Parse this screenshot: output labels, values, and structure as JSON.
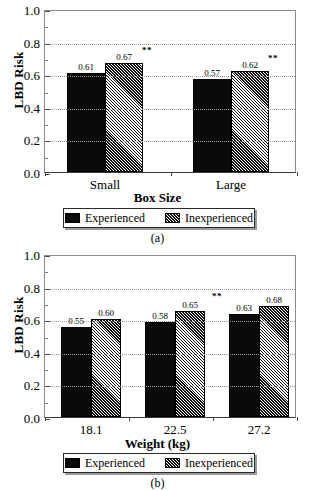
{
  "figure": {
    "panels": [
      {
        "caption": "(a)",
        "ylabel": "LBD Risk",
        "xlabel": "Box Size",
        "ytick_labels": [
          "0.0",
          "0.2",
          "0.4",
          "0.6",
          "0.8",
          "1.0"
        ],
        "xtick_labels": [
          "Small",
          "Large"
        ],
        "legend": [
          {
            "label": "Experienced",
            "style": "solid"
          },
          {
            "label": "Inexperienced",
            "style": "hatch"
          }
        ],
        "value_labels": [
          "0.61",
          "0.67",
          "0.57",
          "0.62"
        ],
        "sig_marks": [
          "**",
          "**"
        ]
      },
      {
        "caption": "(b)",
        "ylabel": "LBD Risk",
        "xlabel": "Weight (kg)",
        "ytick_labels": [
          "0.0",
          "0.2",
          "0.4",
          "0.6",
          "0.8",
          "1.0"
        ],
        "xtick_labels": [
          "18.1",
          "22.5",
          "27.2"
        ],
        "legend": [
          {
            "label": "Experienced",
            "style": "solid"
          },
          {
            "label": "Inexperienced",
            "style": "hatch"
          }
        ],
        "value_labels": [
          "0.55",
          "0.60",
          "0.58",
          "0.65",
          "0.63",
          "0.68"
        ],
        "sig_marks": [
          "**"
        ]
      }
    ]
  },
  "chart_data": [
    {
      "type": "bar",
      "title": "(a)",
      "xlabel": "Box Size",
      "ylabel": "LBD Risk",
      "categories": [
        "Small",
        "Large"
      ],
      "ylim": [
        0.0,
        1.0
      ],
      "ytick_values": [
        0.0,
        0.2,
        0.4,
        0.6,
        0.8,
        1.0
      ],
      "grid": true,
      "legend_position": "below-axis",
      "series": [
        {
          "name": "Experienced",
          "values": [
            0.61,
            0.57
          ],
          "fill": "solid-black"
        },
        {
          "name": "Inexperienced",
          "values": [
            0.67,
            0.62
          ],
          "fill": "diagonal-hatch"
        }
      ],
      "annotations": [
        {
          "category": "Small",
          "series": "Inexperienced",
          "text": "**"
        },
        {
          "category": "Large",
          "series": "Inexperienced",
          "text": "**"
        }
      ]
    },
    {
      "type": "bar",
      "title": "(b)",
      "xlabel": "Weight (kg)",
      "ylabel": "LBD Risk",
      "categories": [
        "18.1",
        "22.5",
        "27.2"
      ],
      "ylim": [
        0.0,
        1.0
      ],
      "ytick_values": [
        0.0,
        0.2,
        0.4,
        0.6,
        0.8,
        1.0
      ],
      "grid": true,
      "legend_position": "below-axis",
      "series": [
        {
          "name": "Experienced",
          "values": [
            0.55,
            0.58,
            0.63
          ],
          "fill": "solid-black"
        },
        {
          "name": "Inexperienced",
          "values": [
            0.6,
            0.65,
            0.68
          ],
          "fill": "diagonal-hatch"
        }
      ],
      "annotations": [
        {
          "category": "22.5",
          "series": "Inexperienced",
          "text": "**"
        }
      ]
    }
  ]
}
